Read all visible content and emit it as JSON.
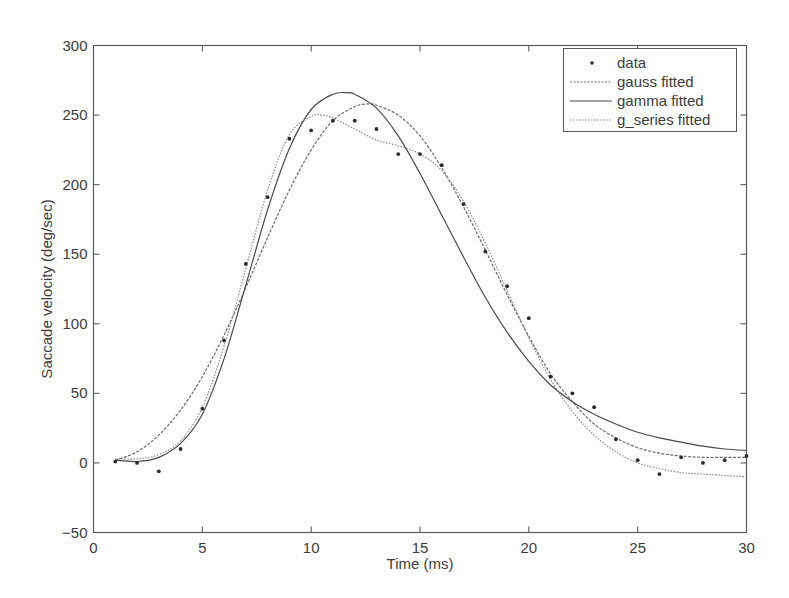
{
  "chart_data": {
    "type": "line",
    "title": "",
    "xlabel": "Time (ms)",
    "ylabel": "Saccade velocity (deg/sec)",
    "xlim": [
      0,
      30
    ],
    "ylim": [
      -50,
      300
    ],
    "xticks": [
      0,
      5,
      10,
      15,
      20,
      25,
      30
    ],
    "yticks": [
      -50,
      0,
      50,
      100,
      150,
      200,
      250,
      300
    ],
    "xtick_labels": [
      "0",
      "5",
      "10",
      "15",
      "20",
      "25",
      "30"
    ],
    "ytick_labels": [
      "−50",
      "0",
      "50",
      "100",
      "150",
      "200",
      "250",
      "300"
    ],
    "grid": false,
    "legend_position": "upper right",
    "legend": [
      "data",
      "gauss fitted",
      "gamma fitted",
      "g_series fitted"
    ],
    "series": [
      {
        "name": "data",
        "style": "markers",
        "x": [
          1,
          2,
          3,
          4,
          5,
          6,
          7,
          8,
          9,
          10,
          11,
          12,
          13,
          14,
          15,
          16,
          17,
          18,
          19,
          20,
          21,
          22,
          23,
          24,
          25,
          26,
          27,
          28,
          29,
          30
        ],
        "values": [
          1,
          0,
          -6,
          10,
          39,
          88,
          143,
          191,
          233,
          239,
          246,
          246,
          240,
          222,
          222,
          214,
          186,
          152,
          127,
          104,
          62,
          50,
          40,
          17,
          2,
          -8,
          4,
          0,
          2,
          5
        ]
      },
      {
        "name": "gauss fitted",
        "style": "dashed",
        "x": [
          1,
          2,
          3,
          4,
          5,
          6,
          7,
          8,
          9,
          10,
          11,
          12,
          12.6,
          13,
          14,
          15,
          16,
          17,
          18,
          19,
          20,
          21,
          22,
          23,
          24,
          25,
          26,
          27,
          28,
          29,
          30
        ],
        "values": [
          2,
          8,
          20,
          38,
          62,
          92,
          126,
          162,
          196,
          225,
          246,
          256,
          258,
          257,
          250,
          235,
          212,
          184,
          153,
          121,
          91,
          64,
          44,
          28,
          18,
          11,
          7,
          5,
          4,
          4,
          4
        ]
      },
      {
        "name": "gamma fitted",
        "style": "solid",
        "x": [
          1,
          2,
          3,
          4,
          5,
          6,
          7,
          8,
          9,
          10,
          11,
          11.7,
          12,
          13,
          14,
          15,
          16,
          17,
          18,
          19,
          20,
          21,
          22,
          23,
          24,
          25,
          26,
          27,
          28,
          29,
          30
        ],
        "values": [
          2,
          1,
          4,
          14,
          35,
          75,
          128,
          182,
          226,
          254,
          265,
          266,
          265,
          255,
          235,
          208,
          178,
          148,
          119,
          94,
          73,
          56,
          44,
          35,
          28,
          22,
          18,
          15,
          12,
          10,
          9
        ]
      },
      {
        "name": "g_series fitted",
        "style": "dotted",
        "x": [
          1,
          2,
          3,
          4,
          5,
          6,
          7,
          8,
          9,
          10,
          10.5,
          11,
          12,
          13,
          14,
          15,
          16,
          17,
          18,
          19,
          20,
          21,
          22,
          23,
          24,
          25,
          26,
          27,
          28,
          29,
          30
        ],
        "values": [
          3,
          3,
          6,
          16,
          40,
          84,
          140,
          196,
          236,
          249,
          250,
          248,
          240,
          232,
          228,
          222,
          210,
          188,
          158,
          124,
          90,
          60,
          37,
          20,
          8,
          0,
          -4,
          -7,
          -8,
          -9,
          -10
        ]
      }
    ]
  },
  "legend": {
    "items": [
      {
        "label": "data",
        "style": "marker"
      },
      {
        "label": "gauss fitted",
        "style": "dashed"
      },
      {
        "label": "gamma fitted",
        "style": "solid"
      },
      {
        "label": "g_series fitted",
        "style": "dotted"
      }
    ]
  },
  "colors": {
    "axis": "#5a5a5a",
    "text": "#3c3c3c",
    "data_marker": "#2a2a2a",
    "gauss": "#6a6a6a",
    "gamma": "#4a4a4a",
    "g_series": "#8a8a8a"
  }
}
